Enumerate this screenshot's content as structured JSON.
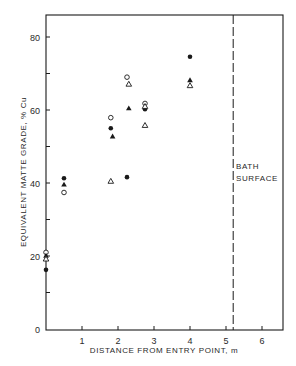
{
  "chart_data": {
    "type": "scatter",
    "title": "",
    "xlabel": "DISTANCE FROM ENTRY POINT, m",
    "ylabel": "EQUIVALENT MATTE GRADE, % Cu",
    "xlim": [
      0,
      6.5
    ],
    "ylim": [
      0,
      86
    ],
    "x_ticks": [
      1,
      2,
      3,
      4,
      5,
      6
    ],
    "y_ticks": [
      0,
      20,
      40,
      60,
      80
    ],
    "y_minor_ticks": [
      10,
      30,
      50,
      70
    ],
    "grid": false,
    "legend": null,
    "annotations": [
      {
        "type": "vline",
        "x": 5.2,
        "style": "dashed",
        "label": "BATH SURFACE",
        "label_lines": [
          "BATH",
          "SURFACE"
        ]
      }
    ],
    "series": [
      {
        "name": "filled-circle",
        "marker": "filled-circle",
        "points": [
          [
            0,
            16.2
          ],
          [
            0.5,
            41.3
          ],
          [
            1.8,
            55.0
          ],
          [
            2.25,
            41.6
          ],
          [
            2.75,
            60.2
          ],
          [
            4.0,
            74.6
          ]
        ]
      },
      {
        "name": "open-circle",
        "marker": "open-circle",
        "points": [
          [
            0,
            21.0
          ],
          [
            0.5,
            37.4
          ],
          [
            1.8,
            57.9
          ],
          [
            2.25,
            69.0
          ],
          [
            2.75,
            61.8
          ]
        ]
      },
      {
        "name": "filled-triangle",
        "marker": "filled-triangle",
        "points": [
          [
            0,
            20.1
          ],
          [
            0.5,
            39.6
          ],
          [
            1.85,
            52.8
          ],
          [
            2.3,
            60.5
          ],
          [
            4.0,
            68.2
          ]
        ]
      },
      {
        "name": "open-triangle",
        "marker": "open-triangle",
        "points": [
          [
            0,
            19.2
          ],
          [
            1.8,
            40.5
          ],
          [
            2.3,
            67.1
          ],
          [
            2.75,
            55.8
          ],
          [
            2.75,
            61.0
          ],
          [
            4.0,
            66.7
          ]
        ]
      }
    ]
  },
  "labels": {
    "xlabel": "DISTANCE FROM ENTRY POINT, m",
    "ylabel": "EQUIVALENT MATTE GRADE, % Cu",
    "bath_line1": "BATH",
    "bath_line2": "SURFACE"
  },
  "colors": {
    "ink": "#1a1a1a",
    "background": "#ffffff"
  }
}
